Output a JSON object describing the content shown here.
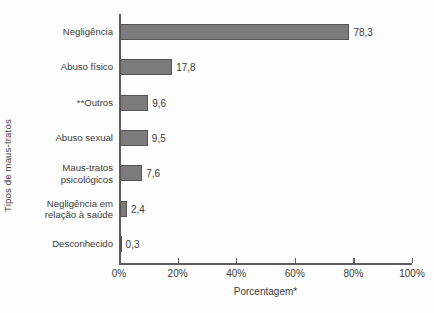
{
  "chart_data": {
    "type": "bar",
    "orientation": "horizontal",
    "title": "",
    "xlabel": "Porcentagem*",
    "ylabel": "Tipos de maus-tratos",
    "categories": [
      "Negligência",
      "Abuso físico",
      "**Outros",
      "Abuso sexual",
      "Maus-tratos\npsicológicos",
      "Negligência em\nrelação à saúde",
      "Desconhecido"
    ],
    "values": [
      78.3,
      17.8,
      9.6,
      9.5,
      7.6,
      2.4,
      0.3
    ],
    "value_labels": [
      "78,3",
      "17,8",
      "9,6",
      "9,5",
      "7,6",
      "2,4",
      "0,3"
    ],
    "xlim": [
      0,
      100
    ],
    "xticks": [
      0,
      20,
      40,
      60,
      80,
      100
    ],
    "xtick_labels": [
      "0%",
      "20%",
      "40%",
      "60%",
      "80%",
      "100%"
    ],
    "grid": false,
    "legend": null,
    "bar_color": "#7b7b7b",
    "bar_edge_color": "#555555",
    "axis_color": "#5d5d5d",
    "background": "#fdfdfd"
  }
}
